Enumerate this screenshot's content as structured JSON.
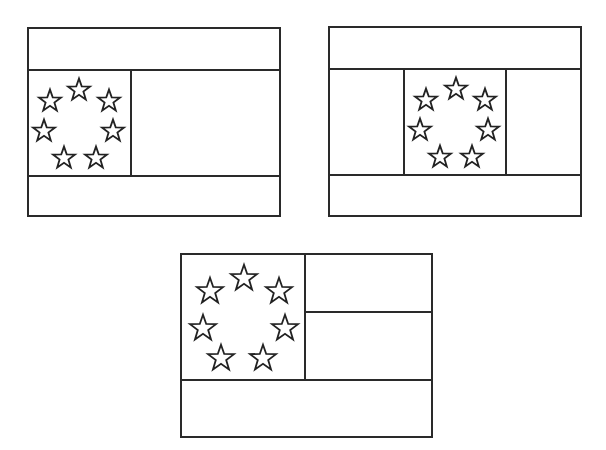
{
  "diagram": {
    "line_color": "#2a2a2a",
    "background": "#ffffff",
    "flags": [
      {
        "id": "flag-1",
        "name": "Flag with left canton in middle band",
        "frame": {
          "x": 28,
          "y": 28,
          "w": 252,
          "h": 188
        },
        "lines": [
          {
            "x1": 28,
            "y1": 70,
            "x2": 280,
            "y2": 70
          },
          {
            "x1": 28,
            "y1": 176,
            "x2": 280,
            "y2": 176
          },
          {
            "x1": 131,
            "y1": 70,
            "x2": 131,
            "y2": 176
          }
        ],
        "star_size": 22,
        "stars": [
          {
            "cx": 79,
            "cy": 89
          },
          {
            "cx": 50,
            "cy": 100
          },
          {
            "cx": 109,
            "cy": 100
          },
          {
            "cx": 44,
            "cy": 130
          },
          {
            "cx": 113,
            "cy": 130
          },
          {
            "cx": 64,
            "cy": 157
          },
          {
            "cx": 96,
            "cy": 157
          }
        ]
      },
      {
        "id": "flag-2",
        "name": "Flag with centered canton in middle band",
        "frame": {
          "x": 329,
          "y": 27,
          "w": 252,
          "h": 189
        },
        "lines": [
          {
            "x1": 329,
            "y1": 69,
            "x2": 581,
            "y2": 69
          },
          {
            "x1": 329,
            "y1": 175,
            "x2": 581,
            "y2": 175
          },
          {
            "x1": 404,
            "y1": 69,
            "x2": 404,
            "y2": 175
          },
          {
            "x1": 506,
            "y1": 69,
            "x2": 506,
            "y2": 175
          }
        ],
        "star_size": 22,
        "stars": [
          {
            "cx": 456,
            "cy": 88
          },
          {
            "cx": 426,
            "cy": 99
          },
          {
            "cx": 485,
            "cy": 99
          },
          {
            "cx": 420,
            "cy": 129
          },
          {
            "cx": 488,
            "cy": 129
          },
          {
            "cx": 440,
            "cy": 156
          },
          {
            "cx": 472,
            "cy": 156
          }
        ]
      },
      {
        "id": "flag-3",
        "name": "Flag with top-left canton and two stripes beside it",
        "frame": {
          "x": 181,
          "y": 254,
          "w": 251,
          "h": 183
        },
        "lines": [
          {
            "x1": 181,
            "y1": 380,
            "x2": 432,
            "y2": 380
          },
          {
            "x1": 305,
            "y1": 254,
            "x2": 305,
            "y2": 380
          },
          {
            "x1": 305,
            "y1": 312,
            "x2": 432,
            "y2": 312
          }
        ],
        "star_size": 26,
        "stars": [
          {
            "cx": 244,
            "cy": 277
          },
          {
            "cx": 210,
            "cy": 290
          },
          {
            "cx": 279,
            "cy": 290
          },
          {
            "cx": 203,
            "cy": 327
          },
          {
            "cx": 285,
            "cy": 327
          },
          {
            "cx": 221,
            "cy": 357
          },
          {
            "cx": 263,
            "cy": 357
          }
        ]
      }
    ]
  }
}
